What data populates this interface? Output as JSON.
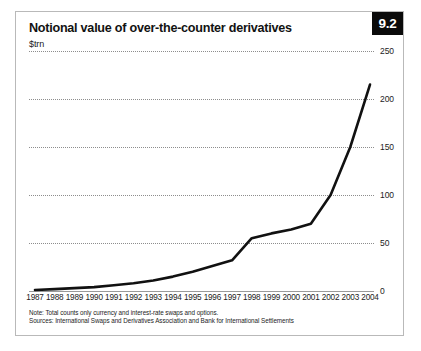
{
  "badge": {
    "label": "9.2"
  },
  "header": {
    "title": "Notional value of over-the-counter derivatives",
    "subtitle": "$trn"
  },
  "notes": {
    "note": "Note: Total counts only currency and interest-rate swaps and options.",
    "sources": "Sources: International Swaps and Derivatives Association and Bank for International Settlements"
  },
  "colors": {
    "line": "#111111",
    "grid": "#8d8d8d",
    "axis": "#9a9a9a",
    "badge_bg": "#0a0a0a",
    "badge_text": "#ffffff",
    "frame": "#b9b9b9",
    "text": "#121212"
  },
  "chart_data": {
    "type": "line",
    "title": "Notional value of over-the-counter derivatives",
    "subtitle": "$trn",
    "xlabel": "",
    "ylabel": "$trn",
    "ylim": [
      0,
      250
    ],
    "yticks": [
      0,
      50,
      100,
      150,
      200,
      250
    ],
    "grid": true,
    "legend": "none",
    "categories": [
      "1987",
      "1988",
      "1989",
      "1990",
      "1991",
      "1992",
      "1993",
      "1994",
      "1995",
      "1996",
      "1997",
      "1998",
      "1999",
      "2000",
      "2001",
      "2002",
      "2003",
      "2004"
    ],
    "values": [
      1,
      2,
      3,
      4,
      6,
      8,
      11,
      15,
      20,
      26,
      32,
      55,
      60,
      64,
      70,
      100,
      150,
      215
    ],
    "series": [
      {
        "name": "Notional value of OTC derivatives",
        "values": [
          1,
          2,
          3,
          4,
          6,
          8,
          11,
          15,
          20,
          26,
          32,
          55,
          60,
          64,
          70,
          100,
          150,
          215
        ]
      }
    ]
  }
}
